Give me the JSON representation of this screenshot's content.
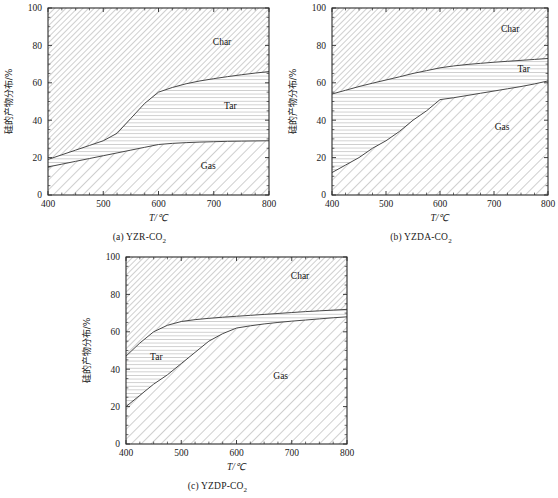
{
  "figure": {
    "axis_label_x": "T/℃",
    "axis_label_y": "硅的产物分布/%",
    "region_labels": {
      "char": "Char",
      "tar": "Tar",
      "gas": "Gas"
    },
    "colors": {
      "line": "#333333",
      "hatch": "#8c8c8c",
      "axis": "#2b2b2b",
      "background": "#ffffff"
    }
  },
  "panels": [
    {
      "id": "a",
      "caption_prefix": "(a) YZR-CO",
      "caption_sub": "2",
      "caption": "(a) YZR-CO2",
      "chart_data": {
        "type": "area",
        "title": "(a) YZR-CO2",
        "xlabel": "T/℃",
        "ylabel": "硅的产物分布/%",
        "xlim": [
          400,
          800
        ],
        "ylim": [
          0,
          100
        ],
        "xticks": [
          400,
          500,
          600,
          700,
          800
        ],
        "yticks": [
          0,
          20,
          40,
          60,
          80,
          100
        ],
        "minor_ticks": true,
        "grid": false,
        "legend": "in-plot region labels",
        "x": [
          400,
          425,
          450,
          475,
          500,
          525,
          550,
          575,
          600,
          625,
          650,
          675,
          700,
          725,
          750,
          775,
          800
        ],
        "series": [
          {
            "name": "Gas",
            "label": "Gas",
            "values": [
              15,
              16.5,
              18,
              19.5,
              21,
              22.5,
              24,
              25.5,
              27,
              27.6,
              28,
              28.3,
              28.5,
              28.7,
              28.8,
              28.9,
              29
            ]
          },
          {
            "name": "Tar",
            "label": "Tar",
            "values": [
              19,
              21.5,
              24,
              26.5,
              29,
              33,
              41,
              49,
              55,
              57.5,
              59.5,
              61,
              62.2,
              63.3,
              64.3,
              65.2,
              66
            ]
          },
          {
            "name": "Char",
            "label": "Char",
            "values": [
              100,
              100,
              100,
              100,
              100,
              100,
              100,
              100,
              100,
              100,
              100,
              100,
              100,
              100,
              100,
              100,
              100
            ]
          }
        ],
        "boundary_notes": {
          "char_tar_boundary_start": 19,
          "char_tar_boundary_end": 66,
          "tar_gas_boundary_start": 15,
          "tar_gas_boundary_end": 29
        }
      }
    },
    {
      "id": "b",
      "caption_prefix": "(b) YZDA-CO",
      "caption_sub": "2",
      "caption": "(b) YZDA-CO2",
      "chart_data": {
        "type": "area",
        "title": "(b) YZDA-CO2",
        "xlabel": "T/℃",
        "ylabel": "硅的产物分布/%",
        "xlim": [
          400,
          800
        ],
        "ylim": [
          0,
          100
        ],
        "xticks": [
          400,
          500,
          600,
          700,
          800
        ],
        "yticks": [
          0,
          20,
          40,
          60,
          80,
          100
        ],
        "minor_ticks": true,
        "grid": false,
        "legend": "in-plot region labels",
        "x": [
          400,
          425,
          450,
          475,
          500,
          525,
          550,
          575,
          600,
          625,
          650,
          675,
          700,
          725,
          750,
          775,
          800
        ],
        "series": [
          {
            "name": "Gas",
            "label": "Gas",
            "values": [
              12,
              16,
              20,
              25,
              29,
              34,
              40,
              45,
              51,
              52,
              53.2,
              54.4,
              55.6,
              56.8,
              58,
              59.4,
              61
            ]
          },
          {
            "name": "Tar",
            "label": "Tar",
            "values": [
              54,
              56,
              58,
              59.8,
              61.5,
              63.2,
              65,
              66.5,
              68,
              69,
              69.8,
              70.4,
              71,
              71.5,
              72,
              72.5,
              73
            ]
          },
          {
            "name": "Char",
            "label": "Char",
            "values": [
              100,
              100,
              100,
              100,
              100,
              100,
              100,
              100,
              100,
              100,
              100,
              100,
              100,
              100,
              100,
              100,
              100
            ]
          }
        ],
        "boundary_notes": {
          "char_tar_boundary_start": 54,
          "char_tar_boundary_end": 73,
          "tar_gas_boundary_start": 12,
          "tar_gas_boundary_end": 61
        }
      }
    },
    {
      "id": "c",
      "caption_prefix": "(c) YZDP-CO",
      "caption_sub": "2",
      "caption": "(c) YZDP-CO2",
      "chart_data": {
        "type": "area",
        "title": "(c) YZDP-CO2",
        "xlabel": "T/℃",
        "ylabel": "硅的产物分布/%",
        "xlim": [
          400,
          800
        ],
        "ylim": [
          0,
          100
        ],
        "xticks": [
          400,
          500,
          600,
          700,
          800
        ],
        "yticks": [
          0,
          20,
          40,
          60,
          80,
          100
        ],
        "minor_ticks": true,
        "grid": false,
        "legend": "in-plot region labels",
        "x": [
          400,
          425,
          450,
          475,
          500,
          525,
          550,
          575,
          600,
          625,
          650,
          675,
          700,
          725,
          750,
          775,
          800
        ],
        "series": [
          {
            "name": "Gas",
            "label": "Gas",
            "values": [
              20,
              26,
              32,
              37,
              43,
              49,
              55,
              59,
              62,
              63.2,
              64.2,
              65,
              65.7,
              66.3,
              66.9,
              67.5,
              68
            ]
          },
          {
            "name": "Tar",
            "label": "Tar",
            "values": [
              47,
              54,
              60,
              63.5,
              65.5,
              66.5,
              67.2,
              67.8,
              68.3,
              68.8,
              69.3,
              69.8,
              70.3,
              70.8,
              71.2,
              71.6,
              72
            ]
          },
          {
            "name": "Char",
            "label": "Char",
            "values": [
              100,
              100,
              100,
              100,
              100,
              100,
              100,
              100,
              100,
              100,
              100,
              100,
              100,
              100,
              100,
              100,
              100
            ]
          }
        ],
        "boundary_notes": {
          "char_tar_boundary_start": 47,
          "char_tar_boundary_end": 72,
          "tar_gas_boundary_start": 20,
          "tar_gas_boundary_end": 68
        }
      }
    }
  ]
}
